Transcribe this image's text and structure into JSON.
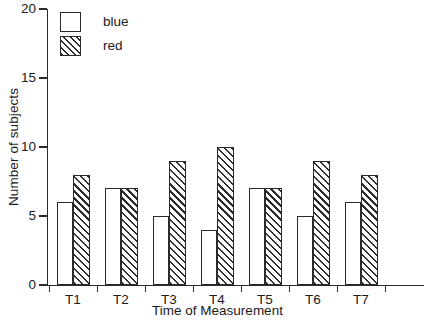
{
  "chart_data": {
    "type": "bar",
    "title": "",
    "subtitle": "",
    "xlabel": "Time of Measurement",
    "ylabel": "Number of subjects",
    "categories": [
      "T1",
      "T2",
      "T3",
      "T4",
      "T5",
      "T6",
      "T7"
    ],
    "series": [
      {
        "name": "blue",
        "values": [
          6,
          7,
          5,
          4,
          7,
          5,
          6
        ]
      },
      {
        "name": "red",
        "values": [
          8,
          7,
          9,
          10,
          7,
          9,
          8
        ]
      }
    ],
    "legend": [
      "blue",
      "red"
    ],
    "legend_position": "top-left",
    "ylim": [
      0,
      20
    ],
    "yticks": [
      0,
      5,
      10,
      15,
      20
    ],
    "ytick_labels": [
      "0",
      "5",
      "10",
      "15",
      "20"
    ],
    "grid": false,
    "axis_color": "#2b2b2b",
    "background": "#ffffff",
    "series_styles": [
      {
        "name": "blue",
        "fill": "#ffffff",
        "edge": "#2b2b2b",
        "hatch": "none"
      },
      {
        "name": "red",
        "fill": "#ffffff",
        "edge": "#2b2b2b",
        "hatch": "forward-diagonal"
      }
    ]
  }
}
